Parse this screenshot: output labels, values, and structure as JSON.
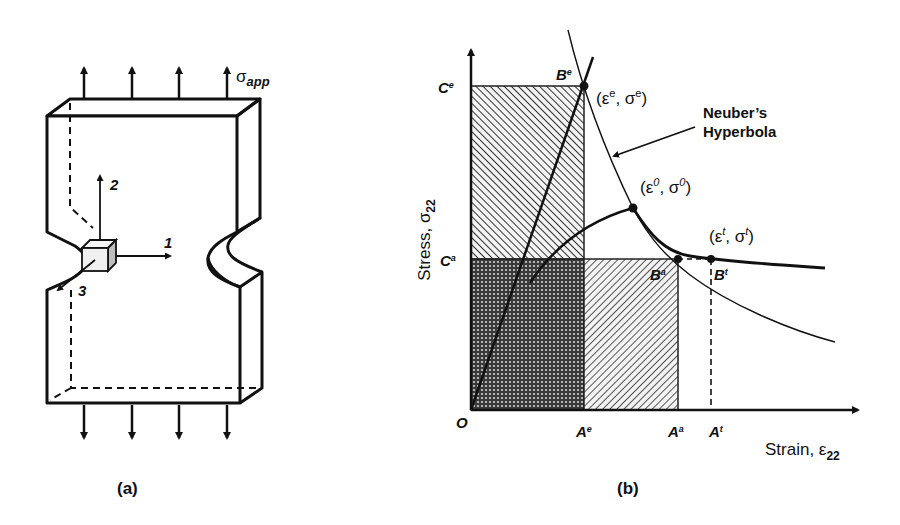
{
  "panel_a": {
    "caption": "(a)",
    "applied_stress_label": "σ",
    "applied_stress_sub": "app",
    "axes": {
      "axis1": "1",
      "axis2": "2",
      "axis3": "3"
    }
  },
  "panel_b": {
    "caption": "(b)",
    "y_axis_label": "Stress, σ",
    "y_axis_sub": "22",
    "x_axis_label": "Strain, ε",
    "x_axis_sub": "22",
    "origin_label": "O",
    "y_ticks": {
      "Ce": "C",
      "Ce_sup": "e",
      "Ca": "C",
      "Ca_sup": "a"
    },
    "x_ticks": {
      "Ae": "A",
      "Ae_sup": "e",
      "Aa": "A",
      "Aa_sup": "a",
      "At": "A",
      "At_sup": "t"
    },
    "points": {
      "Be": "B",
      "Be_sup": "e",
      "Ba": "B",
      "Ba_sup": "a",
      "Bt": "B",
      "Bt_sup": "t",
      "elastic_coord": {
        "open": "(ε",
        "e1": "e",
        "mid": ", σ",
        "e2": "e",
        "close": ")"
      },
      "zero_coord": {
        "open": "(ε",
        "e1": "0",
        "mid": ", σ",
        "e2": "0",
        "close": ")"
      },
      "true_coord": {
        "open": "(ε",
        "e1": "t",
        "mid": ", σ",
        "e2": "t",
        "close": ")"
      }
    },
    "annotation": {
      "line1": "Neuber’s",
      "line2": "Hyperbola"
    }
  }
}
